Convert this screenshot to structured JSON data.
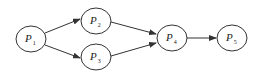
{
  "diagram": {
    "type": "directed-graph",
    "nodes": [
      {
        "id": "P1",
        "base": "P",
        "sub": "1",
        "cx": 31,
        "cy": 39
      },
      {
        "id": "P2",
        "base": "P",
        "sub": "2",
        "cx": 96,
        "cy": 21
      },
      {
        "id": "P3",
        "base": "P",
        "sub": "3",
        "cx": 96,
        "cy": 57
      },
      {
        "id": "P4",
        "base": "P",
        "sub": "4",
        "cx": 172,
        "cy": 38
      },
      {
        "id": "P5",
        "base": "P",
        "sub": "5",
        "cx": 232,
        "cy": 38
      }
    ],
    "edges": [
      {
        "from": "P1",
        "to": "P2"
      },
      {
        "from": "P1",
        "to": "P3"
      },
      {
        "from": "P2",
        "to": "P4"
      },
      {
        "from": "P3",
        "to": "P4"
      },
      {
        "from": "P4",
        "to": "P5"
      }
    ],
    "colors": {
      "stroke": "#333333",
      "background": "#ffffff"
    }
  }
}
